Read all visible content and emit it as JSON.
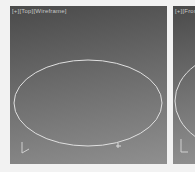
{
  "viewports": [
    {
      "name": "left",
      "label": "[+][Top][Wireframe]",
      "shape": "ellipse"
    },
    {
      "name": "right",
      "label": "[+][Front]",
      "shape": "ellipse"
    }
  ],
  "colors": {
    "background": "#f2f2f2",
    "shape_line": "#e6e6e6",
    "axis": "#d0d0d0"
  }
}
